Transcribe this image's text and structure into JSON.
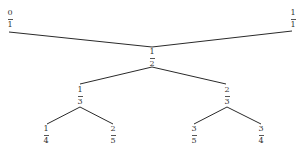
{
  "nodes": [
    {
      "id": "n01",
      "num": "0",
      "den": "1"
    },
    {
      "id": "n11",
      "num": "1",
      "den": "1"
    },
    {
      "id": "n12",
      "num": "1",
      "den": "2"
    },
    {
      "id": "n13",
      "num": "1",
      "den": "3"
    },
    {
      "id": "n23",
      "num": "2",
      "den": "3"
    },
    {
      "id": "n14",
      "num": "1",
      "den": "4"
    },
    {
      "id": "n25",
      "num": "2",
      "den": "5"
    },
    {
      "id": "n35",
      "num": "3",
      "den": "5"
    },
    {
      "id": "n34",
      "num": "3",
      "den": "4"
    }
  ],
  "edges": [
    {
      "from": "n01",
      "to": "n12"
    },
    {
      "from": "n11",
      "to": "n12"
    },
    {
      "from": "n12",
      "to": "n13"
    },
    {
      "from": "n12",
      "to": "n23"
    },
    {
      "from": "n13",
      "to": "n14"
    },
    {
      "from": "n13",
      "to": "n25"
    },
    {
      "from": "n23",
      "to": "n35"
    },
    {
      "from": "n23",
      "to": "n34"
    }
  ]
}
